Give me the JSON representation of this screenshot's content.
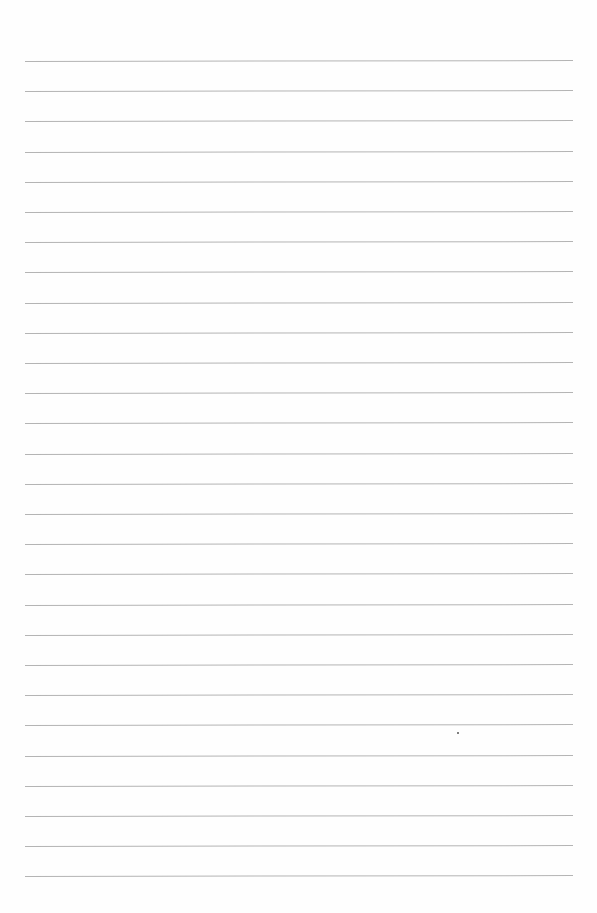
{
  "page": {
    "type": "lined-paper",
    "background_color": "#fefefe",
    "line_color": "#b4b4b4",
    "line_count": 28,
    "line_left": 25,
    "line_right": 573,
    "first_line_y": 61,
    "line_spacing": 30.2,
    "tilt_deg": -0.1
  },
  "text": []
}
